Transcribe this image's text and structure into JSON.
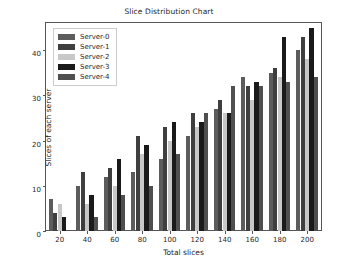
{
  "chart_data": {
    "type": "bar",
    "title": "Slice Distribution Chart",
    "xlabel": "Total slices",
    "ylabel": "Slices of each server",
    "categories": [
      "20",
      "40",
      "60",
      "80",
      "100",
      "120",
      "140",
      "160",
      "180",
      "200"
    ],
    "xticks": [
      "20",
      "40",
      "60",
      "80",
      "100",
      "120",
      "140",
      "160",
      "180",
      "200"
    ],
    "yticks": [
      "0",
      "10",
      "20",
      "30",
      "40"
    ],
    "ylim": [
      0,
      46
    ],
    "grid": false,
    "legend_position": "upper left",
    "series": [
      {
        "name": "Server-0",
        "color": "#5c5c5c",
        "values": [
          7,
          10,
          12,
          13,
          16,
          21,
          27,
          34,
          35,
          40
        ]
      },
      {
        "name": "Server-1",
        "color": "#3f3f3f",
        "values": [
          4,
          13,
          14,
          21,
          23,
          26,
          29,
          32,
          36,
          43
        ]
      },
      {
        "name": "Server-2",
        "color": "#c8c8c8",
        "values": [
          6,
          6,
          10,
          17,
          20,
          23,
          26,
          29,
          34,
          38
        ]
      },
      {
        "name": "Server-3",
        "color": "#1a1a1a",
        "values": [
          3,
          8,
          16,
          19,
          24,
          24,
          26,
          33,
          43,
          45
        ]
      },
      {
        "name": "Server-4",
        "color": "#4f4f4f",
        "values": [
          0,
          3,
          8,
          10,
          17,
          26,
          32,
          32,
          33,
          34
        ]
      }
    ]
  },
  "legend": {
    "items": [
      {
        "label": "Server-0"
      },
      {
        "label": "Server-1"
      },
      {
        "label": "Server-2"
      },
      {
        "label": "Server-3"
      },
      {
        "label": "Server-4"
      }
    ]
  }
}
